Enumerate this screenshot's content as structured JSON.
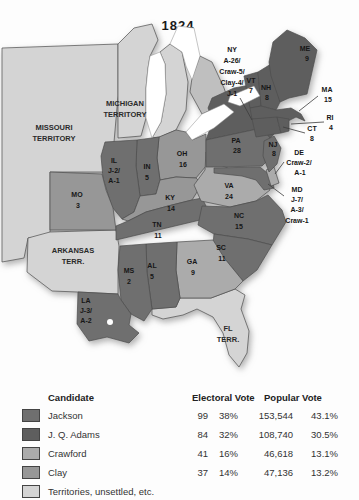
{
  "title": "1824",
  "colors": {
    "jackson": "#6f6f6f",
    "adams": "#5e5e5e",
    "crawford": "#ababab",
    "clay": "#979797",
    "territory": "#d4d4d4",
    "canada": "#bfbfbf",
    "water": "#ffffff"
  },
  "map": {
    "territories": {
      "missouri": [
        "MISSOURI",
        "TERRITORY"
      ],
      "michigan": [
        "MICHIGAN",
        "TERRITORY"
      ],
      "arkansas": [
        "ARKANSAS",
        "TERR."
      ],
      "florida": [
        "FL",
        "TERR."
      ]
    },
    "states": {
      "me": {
        "party": "adams",
        "lines": [
          "ME",
          "9"
        ]
      },
      "vt": {
        "party": "adams",
        "lines": [
          "VT",
          "7"
        ]
      },
      "nh": {
        "party": "adams",
        "lines": [
          "NH",
          "8"
        ]
      },
      "ma": {
        "party": "adams",
        "lines": [
          "MA",
          "15"
        ]
      },
      "ri": {
        "party": "adams",
        "lines": [
          "RI",
          "4"
        ]
      },
      "ct": {
        "party": "adams",
        "lines": [
          "CT",
          "8"
        ]
      },
      "ny": {
        "party": "adams",
        "lines": [
          "NY",
          "A-26/",
          "Craw-5/",
          "Clay-4/",
          "J-1"
        ]
      },
      "pa": {
        "party": "jackson",
        "lines": [
          "PA",
          "28"
        ]
      },
      "nj": {
        "party": "jackson",
        "lines": [
          "NJ",
          "8"
        ]
      },
      "de": {
        "party": "crawford",
        "lines": [
          "DE",
          "Craw-2/",
          "A-1"
        ]
      },
      "md": {
        "party": "jackson",
        "lines": [
          "MD",
          "J-7/",
          "A-3/",
          "Craw-1"
        ]
      },
      "va": {
        "party": "crawford",
        "lines": [
          "VA",
          "24"
        ]
      },
      "nc": {
        "party": "jackson",
        "lines": [
          "NC",
          "15"
        ]
      },
      "sc": {
        "party": "jackson",
        "lines": [
          "SC",
          "11"
        ]
      },
      "ga": {
        "party": "crawford",
        "lines": [
          "GA",
          "9"
        ]
      },
      "al": {
        "party": "jackson",
        "lines": [
          "AL",
          "5"
        ]
      },
      "ms": {
        "party": "jackson",
        "lines": [
          "MS",
          "2"
        ]
      },
      "tn": {
        "party": "jackson",
        "lines": [
          "TN",
          "11"
        ]
      },
      "ky": {
        "party": "clay",
        "lines": [
          "KY",
          "14"
        ]
      },
      "oh": {
        "party": "clay",
        "lines": [
          "OH",
          "16"
        ]
      },
      "in": {
        "party": "jackson",
        "lines": [
          "IN",
          "5"
        ]
      },
      "il": {
        "party": "jackson",
        "lines": [
          "IL",
          "J-2/",
          "A-1"
        ]
      },
      "mo": {
        "party": "clay",
        "lines": [
          "MO",
          "3"
        ]
      },
      "la": {
        "party": "jackson",
        "lines": [
          "LA",
          "J-3/",
          "A-2"
        ]
      }
    }
  },
  "legend": {
    "headers": {
      "candidate": "Candidate",
      "electoral": "Electoral Vote",
      "popular": "Popular Vote"
    },
    "rows": [
      {
        "name": "Jackson",
        "party": "jackson",
        "ev": "99",
        "ev_pct": "38%",
        "pv": "153,544",
        "pv_pct": "43.1%"
      },
      {
        "name": "J. Q. Adams",
        "party": "adams",
        "ev": "84",
        "ev_pct": "32%",
        "pv": "108,740",
        "pv_pct": "30.5%"
      },
      {
        "name": "Crawford",
        "party": "crawford",
        "ev": "41",
        "ev_pct": "16%",
        "pv": "46,618",
        "pv_pct": "13.1%"
      },
      {
        "name": "Clay",
        "party": "clay",
        "ev": "37",
        "ev_pct": "14%",
        "pv": "47,136",
        "pv_pct": "13.2%"
      },
      {
        "name": "Territories, unsettled, etc.",
        "party": "territory",
        "ev": "",
        "ev_pct": "",
        "pv": "",
        "pv_pct": ""
      }
    ]
  }
}
